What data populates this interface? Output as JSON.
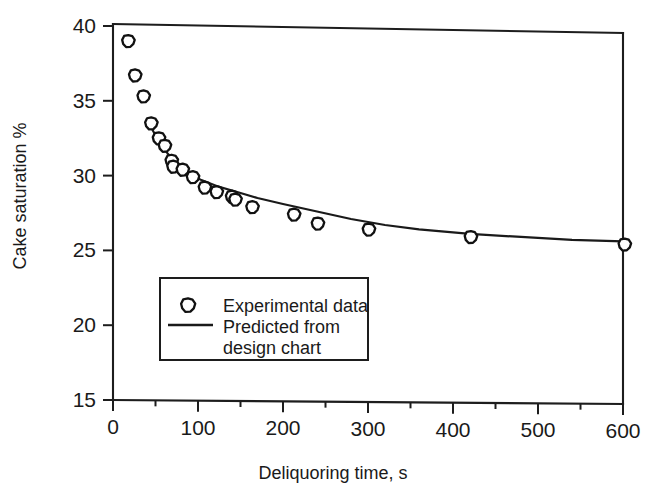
{
  "chart_data": {
    "type": "scatter",
    "title": "",
    "xlabel": "Deliquoring time,  s",
    "ylabel": "Cake saturation  %",
    "xlim": [
      0,
      600
    ],
    "ylim": [
      15,
      40
    ],
    "xticks": [
      0,
      100,
      200,
      300,
      400,
      500,
      600
    ],
    "yticks": [
      15,
      20,
      25,
      30,
      35,
      40
    ],
    "xtick_labels": [
      "0",
      "100",
      "200",
      "300",
      "400",
      "500",
      "600"
    ],
    "ytick_labels": [
      "15",
      "20",
      "25",
      "30",
      "35",
      "40"
    ],
    "xminor_step": 50,
    "grid": false,
    "legend_position": "lower-left-inside",
    "series": [
      {
        "name": "Experimental data",
        "type": "scatter",
        "marker": "open-circle",
        "points": [
          [
            18,
            39.0
          ],
          [
            26,
            36.7
          ],
          [
            36,
            35.3
          ],
          [
            45,
            33.5
          ],
          [
            54,
            32.5
          ],
          [
            61,
            32.0
          ],
          [
            69,
            31.0
          ],
          [
            71,
            30.6
          ],
          [
            82,
            30.4
          ],
          [
            94,
            29.9
          ],
          [
            108,
            29.2
          ],
          [
            122,
            28.9
          ],
          [
            140,
            28.6
          ],
          [
            144,
            28.4
          ],
          [
            164,
            27.9
          ],
          [
            213,
            27.4
          ],
          [
            241,
            26.8
          ],
          [
            301,
            26.4
          ],
          [
            421,
            25.9
          ],
          [
            602,
            25.4
          ]
        ]
      },
      {
        "name": "Predicted from design chart",
        "type": "line",
        "points": [
          [
            46,
            33.1
          ],
          [
            55,
            32.2
          ],
          [
            64,
            31.5
          ],
          [
            75,
            30.8
          ],
          [
            88,
            30.2
          ],
          [
            104,
            29.7
          ],
          [
            122,
            29.3
          ],
          [
            140,
            29.0
          ],
          [
            152,
            28.8
          ],
          [
            170,
            28.5
          ],
          [
            200,
            28.1
          ],
          [
            240,
            27.6
          ],
          [
            280,
            27.1
          ],
          [
            320,
            26.7
          ],
          [
            360,
            26.4
          ],
          [
            420,
            26.1
          ],
          [
            480,
            25.9
          ],
          [
            540,
            25.7
          ],
          [
            600,
            25.6
          ]
        ]
      }
    ],
    "legend": {
      "entries": [
        {
          "label": "Experimental data",
          "marker": "open-circle"
        },
        {
          "label_line1": "Predicted from",
          "label_line2": "design chart",
          "marker": "line"
        }
      ]
    }
  },
  "legend": {
    "item1": "Experimental data",
    "item2_line1": "Predicted from",
    "item2_line2": "design chart"
  },
  "axes": {
    "xlabel": "Deliquoring time,  s",
    "ylabel": "Cake saturation  %"
  }
}
